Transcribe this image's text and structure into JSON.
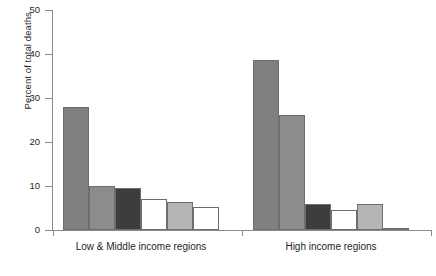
{
  "chart_data": {
    "type": "bar",
    "title": "",
    "subtitle": "",
    "xlabel": "",
    "ylabel": "Percent of total deaths",
    "ylim": [
      0,
      50
    ],
    "yticks": [
      0,
      10,
      20,
      30,
      40,
      50
    ],
    "ytick_labels": [
      "0",
      "10",
      "20",
      "30",
      "40",
      "50"
    ],
    "grid": false,
    "legend": false,
    "legend_position": "none",
    "categories": [
      "Low & Middle income regions",
      "High income regions"
    ],
    "series": [
      {
        "name": "Series 1",
        "color": "#808080",
        "values": [
          28.0,
          38.7
        ]
      },
      {
        "name": "Series 2",
        "color": "#8c8c8c",
        "values": [
          10.1,
          26.1
        ]
      },
      {
        "name": "Series 3",
        "color": "#3d3d3d",
        "values": [
          9.5,
          6.0
        ]
      },
      {
        "name": "Series 4",
        "color": "#ffffff",
        "values": [
          7.0,
          4.5
        ]
      },
      {
        "name": "Series 5",
        "color": "#b5b5b5",
        "values": [
          6.3,
          6.0
        ]
      },
      {
        "name": "Series 6",
        "color": "#ffffff",
        "values": [
          5.2,
          0.4
        ]
      }
    ]
  },
  "axes": {
    "y_title": "Percent of total deaths"
  },
  "bottom_caption": ""
}
